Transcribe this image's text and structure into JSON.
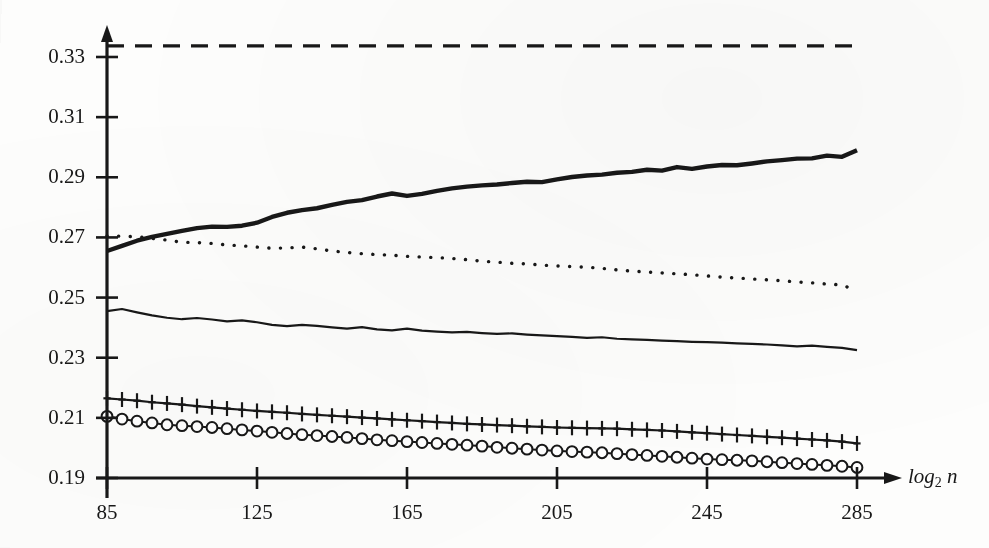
{
  "figure": {
    "background_color": "#fdfdfc",
    "ink_color": "#181818"
  },
  "axes": {
    "x_axis_label": "log",
    "x_axis_label_sub": "2",
    "x_axis_label_var": "n",
    "x_ticks": [
      "85",
      "125",
      "165",
      "205",
      "245",
      "285"
    ],
    "y_ticks": [
      "0.19",
      "0.21",
      "0.23",
      "0.25",
      "0.27",
      "0.29",
      "0.31",
      "0.33"
    ]
  },
  "chart_data": {
    "type": "line",
    "title": "",
    "xlabel": "log_2 n",
    "ylabel": "",
    "xlim": [
      85,
      285
    ],
    "ylim": [
      0.19,
      0.341
    ],
    "grid": false,
    "legend": "none",
    "x_ticks": [
      85,
      125,
      165,
      205,
      245,
      285
    ],
    "y_ticks": [
      0.19,
      0.21,
      0.23,
      0.25,
      0.27,
      0.29,
      0.31,
      0.33
    ],
    "x": [
      85,
      89,
      93,
      97,
      101,
      105,
      109,
      113,
      117,
      121,
      125,
      129,
      133,
      137,
      141,
      145,
      149,
      153,
      157,
      161,
      165,
      169,
      173,
      177,
      181,
      185,
      189,
      193,
      197,
      201,
      205,
      209,
      213,
      217,
      221,
      225,
      229,
      233,
      237,
      241,
      245,
      249,
      253,
      257,
      261,
      265,
      269,
      273,
      277,
      281,
      285
    ],
    "series": [
      {
        "name": "upper-bound-dashed",
        "style": "dashed",
        "marker": "none",
        "line_width": 3.2,
        "color": "#181818",
        "values": [
          0.3337,
          0.3337,
          0.3337,
          0.3337,
          0.3337,
          0.3337,
          0.3337,
          0.3337,
          0.3337,
          0.3337,
          0.3337,
          0.3337,
          0.3337,
          0.3337,
          0.3337,
          0.3337,
          0.3337,
          0.3337,
          0.3337,
          0.3337,
          0.3337,
          0.3337,
          0.3337,
          0.3337,
          0.3337,
          0.3337,
          0.3337,
          0.3337,
          0.3337,
          0.3337,
          0.3337,
          0.3337,
          0.3337,
          0.3337,
          0.3337,
          0.3337,
          0.3337,
          0.3337,
          0.3337,
          0.3337,
          0.3337,
          0.3337,
          0.3337,
          0.3337,
          0.3337,
          0.3337,
          0.3337,
          0.3337,
          0.3337,
          0.3337,
          0.3337
        ]
      },
      {
        "name": "thick-solid-rising",
        "style": "solid",
        "marker": "none",
        "line_width": 4.4,
        "color": "#181818",
        "values": [
          0.2655,
          0.2672,
          0.2689,
          0.2702,
          0.2712,
          0.2722,
          0.2731,
          0.2736,
          0.2735,
          0.2739,
          0.2749,
          0.2768,
          0.2782,
          0.2791,
          0.2797,
          0.2808,
          0.2818,
          0.2824,
          0.2836,
          0.2846,
          0.2838,
          0.2845,
          0.2855,
          0.2863,
          0.2869,
          0.2873,
          0.2876,
          0.2881,
          0.2885,
          0.2884,
          0.2893,
          0.2901,
          0.2906,
          0.2909,
          0.2915,
          0.2918,
          0.2925,
          0.2922,
          0.2934,
          0.2928,
          0.2936,
          0.2941,
          0.294,
          0.2946,
          0.2953,
          0.2957,
          0.2962,
          0.2963,
          0.2972,
          0.2968,
          0.299
        ]
      },
      {
        "name": "dotted-declining",
        "style": "dotted",
        "marker": "none",
        "line_width": 3.0,
        "color": "#181818",
        "values": [
          0.2705,
          0.2704,
          0.2702,
          0.2697,
          0.2691,
          0.2684,
          0.2683,
          0.268,
          0.2675,
          0.2672,
          0.2668,
          0.2664,
          0.2665,
          0.2668,
          0.2662,
          0.2655,
          0.265,
          0.2646,
          0.2643,
          0.2641,
          0.2637,
          0.2635,
          0.2633,
          0.263,
          0.2626,
          0.2621,
          0.2618,
          0.2614,
          0.2612,
          0.2608,
          0.2605,
          0.2603,
          0.2601,
          0.2597,
          0.2592,
          0.2588,
          0.2585,
          0.2582,
          0.2579,
          0.2576,
          0.2572,
          0.2568,
          0.2565,
          0.2562,
          0.2559,
          0.2556,
          0.2552,
          0.2549,
          0.2545,
          0.2542,
          0.2522
        ]
      },
      {
        "name": "thin-solid-declining",
        "style": "solid",
        "marker": "none",
        "line_width": 2.2,
        "color": "#181818",
        "values": [
          0.2455,
          0.2462,
          0.2451,
          0.2441,
          0.2433,
          0.2428,
          0.2432,
          0.2427,
          0.2421,
          0.2424,
          0.2418,
          0.2409,
          0.2405,
          0.2409,
          0.2406,
          0.2401,
          0.2397,
          0.2402,
          0.2394,
          0.2391,
          0.2397,
          0.239,
          0.2387,
          0.2384,
          0.2386,
          0.2382,
          0.2379,
          0.2381,
          0.2377,
          0.2374,
          0.2372,
          0.2369,
          0.2366,
          0.2368,
          0.2363,
          0.2361,
          0.2359,
          0.2357,
          0.2355,
          0.2353,
          0.2352,
          0.235,
          0.2348,
          0.2346,
          0.2344,
          0.2341,
          0.2338,
          0.234,
          0.2336,
          0.2333,
          0.2325
        ]
      },
      {
        "name": "plus-marker-declining",
        "style": "solid",
        "marker": "plus",
        "line_width": 2.2,
        "color": "#181818",
        "values": [
          0.2165,
          0.2161,
          0.2157,
          0.2152,
          0.2148,
          0.2144,
          0.2139,
          0.2135,
          0.2131,
          0.2127,
          0.2123,
          0.212,
          0.2117,
          0.2113,
          0.211,
          0.2107,
          0.2104,
          0.2101,
          0.2098,
          0.2095,
          0.2092,
          0.2089,
          0.2086,
          0.2083,
          0.208,
          0.2078,
          0.2076,
          0.2074,
          0.2072,
          0.207,
          0.2068,
          0.2067,
          0.2066,
          0.2065,
          0.2064,
          0.2062,
          0.206,
          0.2058,
          0.2055,
          0.2052,
          0.2049,
          0.2046,
          0.2043,
          0.204,
          0.2037,
          0.2034,
          0.2031,
          0.2028,
          0.2025,
          0.2021,
          0.2015
        ]
      },
      {
        "name": "circle-marker-declining",
        "style": "solid",
        "marker": "circle",
        "line_width": 2.0,
        "color": "#181818",
        "values": [
          0.2105,
          0.2096,
          0.2089,
          0.2083,
          0.2077,
          0.2074,
          0.2071,
          0.2068,
          0.2064,
          0.206,
          0.2056,
          0.2052,
          0.2048,
          0.2044,
          0.2041,
          0.2038,
          0.2035,
          0.2031,
          0.2027,
          0.2024,
          0.2021,
          0.2018,
          0.2015,
          0.2012,
          0.2009,
          0.2006,
          0.2002,
          0.1999,
          0.1996,
          0.1993,
          0.199,
          0.1988,
          0.1986,
          0.1984,
          0.1981,
          0.1978,
          0.1975,
          0.1972,
          0.1969,
          0.1966,
          0.1963,
          0.1961,
          0.1959,
          0.1957,
          0.1954,
          0.1951,
          0.1948,
          0.1945,
          0.1942,
          0.1939,
          0.1935
        ]
      }
    ]
  }
}
